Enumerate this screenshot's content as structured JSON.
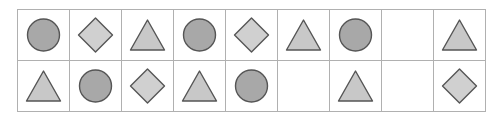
{
  "grid": {
    "columns": 9,
    "rows": 2,
    "cell_width": 51,
    "cell_height": 50,
    "border_color": "#b0b0b0",
    "background_color": "#ffffff"
  },
  "shape_styles": {
    "circle": {
      "fill": "#a8a8a8",
      "stroke": "#555555"
    },
    "triangle": {
      "fill": "#c8c8c8",
      "stroke": "#555555"
    },
    "diamond": {
      "fill": "#d0d0d0",
      "stroke": "#555555"
    },
    "empty": {
      "fill": "none",
      "stroke": "none"
    }
  },
  "rows": [
    {
      "index": 1,
      "cells": [
        {
          "shape": "circle"
        },
        {
          "shape": "diamond"
        },
        {
          "shape": "triangle"
        },
        {
          "shape": "circle"
        },
        {
          "shape": "diamond"
        },
        {
          "shape": "triangle"
        },
        {
          "shape": "circle"
        },
        {
          "shape": "empty"
        },
        {
          "shape": "triangle"
        }
      ]
    },
    {
      "index": 2,
      "cells": [
        {
          "shape": "triangle"
        },
        {
          "shape": "circle"
        },
        {
          "shape": "diamond"
        },
        {
          "shape": "triangle"
        },
        {
          "shape": "circle"
        },
        {
          "shape": "empty"
        },
        {
          "shape": "triangle"
        },
        {
          "shape": "empty"
        },
        {
          "shape": "diamond"
        }
      ]
    }
  ]
}
